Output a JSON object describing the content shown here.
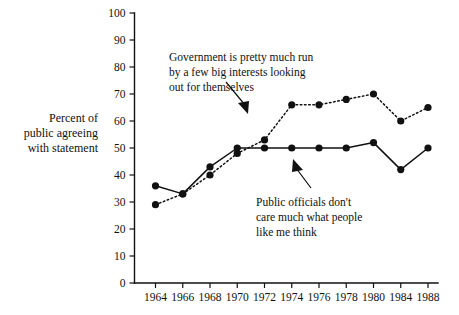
{
  "chart_data": {
    "type": "line",
    "title": "",
    "xlabel": "",
    "ylabel": "Percent of public agreeing with statement",
    "categories": [
      "1964",
      "1966",
      "1968",
      "1970",
      "1972",
      "1974",
      "1976",
      "1978",
      "1980",
      "1984",
      "1988"
    ],
    "ylim": [
      0,
      100
    ],
    "ytick_values": [
      0,
      10,
      20,
      30,
      40,
      50,
      60,
      70,
      80,
      90,
      100
    ],
    "grid": false,
    "legend_position": "annotations-inline",
    "series": [
      {
        "name": "Government is pretty much run by a few big interests looking out for themselves",
        "style": "dotted",
        "values": [
          29,
          33,
          40,
          48,
          53,
          66,
          66,
          68,
          70,
          60,
          65
        ]
      },
      {
        "name": "Public officials don't care much what people like me think",
        "style": "solid",
        "values": [
          36,
          33,
          43,
          50,
          50,
          50,
          50,
          50,
          52,
          42,
          50
        ]
      }
    ],
    "annotations": [
      {
        "id": "annotation-big-interests",
        "lines": [
          "Government is pretty much run",
          "by a few big interests looking",
          "out for themselves"
        ],
        "points_to": "dotted-series"
      },
      {
        "id": "annotation-public-officials",
        "lines": [
          "Public officials don't",
          "care much what people",
          "like me think"
        ],
        "points_to": "solid-series"
      }
    ],
    "axis_label_lines": [
      "Percent of",
      "public agreeing",
      "with statement"
    ],
    "colors": {
      "ink": "#111111",
      "background": "#ffffff"
    }
  }
}
